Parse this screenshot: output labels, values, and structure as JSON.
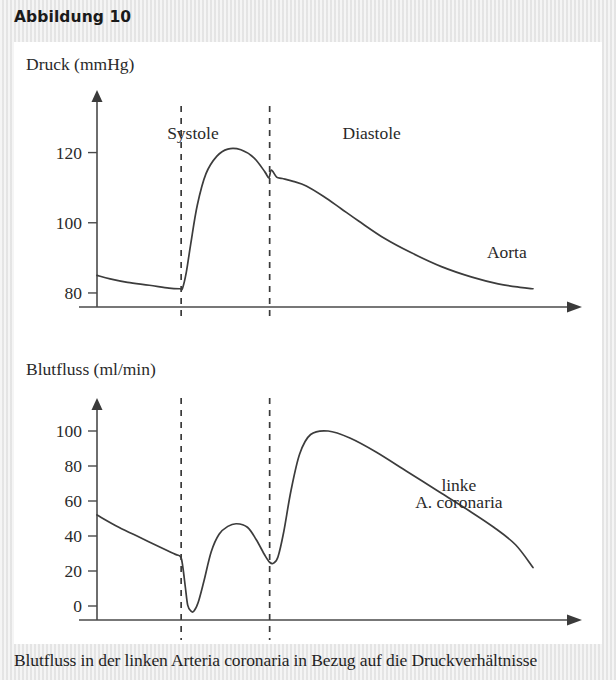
{
  "figure": {
    "title": "Abbildung 10",
    "caption": "Blutfluss in der linken Arteria coronaria in Bezug auf die Druckverhältnisse"
  },
  "chart_data": [
    {
      "type": "line",
      "title": "",
      "ylabel": "Druck (mmHg)",
      "xlabel": "",
      "ylim": [
        76,
        127
      ],
      "yticks": [
        80,
        100,
        120
      ],
      "ytick_labels": [
        "80",
        "100",
        "120"
      ],
      "grid": false,
      "legend": "none",
      "annotations": [
        {
          "text": "Systole",
          "x_frac": 0.22,
          "y_value": 124
        },
        {
          "text": "Diastole",
          "x_frac": 0.63,
          "y_value": 124
        },
        {
          "text": "Aorta",
          "x_frac": 0.94,
          "y_value": 90
        }
      ],
      "phase_markers": [
        {
          "name": "systole-start",
          "x_frac": 0.193
        },
        {
          "name": "systole-end",
          "x_frac": 0.396
        }
      ],
      "series": [
        {
          "name": "Aorta",
          "x": [
            0,
            0.03,
            0.07,
            0.12,
            0.165,
            0.19,
            0.196,
            0.205,
            0.215,
            0.23,
            0.25,
            0.275,
            0.3,
            0.33,
            0.36,
            0.385,
            0.394,
            0.4,
            0.412,
            0.425,
            0.45,
            0.48,
            0.52,
            0.56,
            0.6,
            0.66,
            0.72,
            0.79,
            0.86,
            0.92,
            0.97,
            1.0
          ],
          "y": [
            85.0,
            84.0,
            83.0,
            82.2,
            81.4,
            81.2,
            81.3,
            86.0,
            94.0,
            105.0,
            114.0,
            119.0,
            121.0,
            120.8,
            118.5,
            114.5,
            112.8,
            115.0,
            113.0,
            112.6,
            111.8,
            110.5,
            107.5,
            104.0,
            100.5,
            95.5,
            91.5,
            87.5,
            84.5,
            82.6,
            81.6,
            81.2
          ]
        }
      ]
    },
    {
      "type": "line",
      "title": "",
      "ylabel": "Blutfluss (ml/min)",
      "xlabel": "",
      "ylim": [
        -8,
        112
      ],
      "yticks": [
        0,
        20,
        40,
        60,
        80,
        100
      ],
      "ytick_labels": [
        "0",
        "20",
        "40",
        "60",
        "80",
        "100"
      ],
      "grid": false,
      "legend": "none",
      "annotations": [
        {
          "text": "linke",
          "x_frac": 0.83,
          "y_value": 66
        },
        {
          "text": "A. coronaria",
          "x_frac": 0.83,
          "y_value": 56
        }
      ],
      "phase_markers": [
        {
          "name": "systole-start",
          "x_frac": 0.193
        },
        {
          "name": "systole-end",
          "x_frac": 0.396
        }
      ],
      "series": [
        {
          "name": "linke A. coronaria",
          "x": [
            0,
            0.05,
            0.1,
            0.15,
            0.18,
            0.192,
            0.197,
            0.203,
            0.208,
            0.215,
            0.222,
            0.232,
            0.245,
            0.262,
            0.28,
            0.3,
            0.32,
            0.345,
            0.365,
            0.385,
            0.396,
            0.405,
            0.415,
            0.428,
            0.445,
            0.465,
            0.49,
            0.53,
            0.58,
            0.64,
            0.71,
            0.78,
            0.85,
            0.91,
            0.96,
            1.0
          ],
          "y": [
            52.0,
            45.0,
            39.0,
            33.0,
            29.5,
            28.0,
            22.0,
            10.0,
            0.5,
            -2.8,
            -3.0,
            2.0,
            14.0,
            31.0,
            41.0,
            45.5,
            47.0,
            45.0,
            38.0,
            29.0,
            25.0,
            24.5,
            28.0,
            42.0,
            66.0,
            87.0,
            98.0,
            100.0,
            96.0,
            88.0,
            77.0,
            66.0,
            55.0,
            45.0,
            35.0,
            22.0
          ]
        }
      ]
    }
  ]
}
